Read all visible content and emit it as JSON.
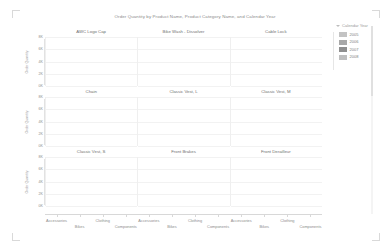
{
  "chart_data": {
    "type": "bar",
    "title": "Order Quantity by Product Name, Product Category Name, and Calendar Year",
    "xlabel": "",
    "ylabel": "Order Quantity",
    "ylim": [
      0,
      8000
    ],
    "yticks": [
      "0K",
      "2K",
      "4K",
      "6K",
      "8K"
    ],
    "grid": true,
    "legend": {
      "title": "Calendar Year",
      "position": "right",
      "entries": [
        {
          "label": "2005",
          "color": "#c3c3c3"
        },
        {
          "label": "2006",
          "color": "#a8a8a8"
        },
        {
          "label": "2007",
          "color": "#8f8f8f"
        },
        {
          "label": "2008",
          "color": "#bfbfbf"
        }
      ]
    },
    "categories": [
      "Accessories",
      "Bikes",
      "Clothing",
      "Components"
    ],
    "panel_rows": [
      {
        "panels": [
          {
            "title": "AWC Logo Cap",
            "bars": [
              {
                "category": "Accessories",
                "segments": []
              },
              {
                "category": "Bikes",
                "segments": []
              },
              {
                "category": "Clothing",
                "segments": [
                  {
                    "series": "2008",
                    "value": 2100,
                    "color": "#9d9d9d"
                  },
                  {
                    "series": "2007",
                    "value": 3900,
                    "color": "#bcbcbc"
                  }
                ]
              },
              {
                "category": "Components",
                "segments": []
              }
            ]
          },
          {
            "title": "Bike Wash - Dissolver",
            "bars": [
              {
                "category": "Accessories",
                "segments": [
                  {
                    "series": "2007",
                    "value": 1900,
                    "color": "#b5b5b5"
                  }
                ]
              },
              {
                "category": "Bikes",
                "segments": []
              },
              {
                "category": "Clothing",
                "segments": []
              },
              {
                "category": "Components",
                "segments": []
              }
            ]
          },
          {
            "title": "Cable Lock",
            "bars": [
              {
                "category": "Accessories",
                "segments": [
                  {
                    "series": "2007",
                    "value": 520,
                    "color": "#7e7e7e"
                  }
                ]
              },
              {
                "category": "Bikes",
                "segments": []
              },
              {
                "category": "Clothing",
                "segments": []
              },
              {
                "category": "Components",
                "segments": []
              }
            ]
          }
        ]
      },
      {
        "panels": [
          {
            "title": "Chain",
            "bars": [
              {
                "category": "Accessories",
                "segments": []
              },
              {
                "category": "Bikes",
                "segments": []
              },
              {
                "category": "Clothing",
                "segments": []
              },
              {
                "category": "Components",
                "segments": []
              }
            ]
          },
          {
            "title": "Classic Vest, L",
            "bars": [
              {
                "category": "Accessories",
                "segments": []
              },
              {
                "category": "Bikes",
                "segments": []
              },
              {
                "category": "Clothing",
                "segments": []
              },
              {
                "category": "Components",
                "segments": []
              }
            ]
          },
          {
            "title": "Classic Vest, M",
            "bars": [
              {
                "category": "Accessories",
                "segments": []
              },
              {
                "category": "Bikes",
                "segments": []
              },
              {
                "category": "Clothing",
                "segments": [
                  {
                    "series": "2008",
                    "value": 1500,
                    "color": "#bdbdbd"
                  }
                ]
              },
              {
                "category": "Components",
                "segments": []
              }
            ]
          }
        ]
      },
      {
        "panels": [
          {
            "title": "Classic Vest, S",
            "bars": [
              {
                "category": "Accessories",
                "segments": []
              },
              {
                "category": "Bikes",
                "segments": []
              },
              {
                "category": "Clothing",
                "segments": [
                  {
                    "series": "2008",
                    "value": 3100,
                    "color": "#b3b3b3"
                  }
                ]
              },
              {
                "category": "Components",
                "segments": []
              }
            ]
          },
          {
            "title": "Front Brakes",
            "bars": [
              {
                "category": "Accessories",
                "segments": []
              },
              {
                "category": "Bikes",
                "segments": []
              },
              {
                "category": "Clothing",
                "segments": []
              },
              {
                "category": "Components",
                "segments": [
                  {
                    "series": "2008",
                    "value": 700,
                    "color": "#c6c6c6"
                  }
                ]
              }
            ]
          },
          {
            "title": "Front Derailleur",
            "bars": [
              {
                "category": "Accessories",
                "segments": []
              },
              {
                "category": "Bikes",
                "segments": []
              },
              {
                "category": "Clothing",
                "segments": []
              },
              {
                "category": "Components",
                "segments": [
                  {
                    "series": "2008",
                    "value": 700,
                    "color": "#c6c6c6"
                  }
                ]
              }
            ]
          }
        ]
      }
    ]
  }
}
